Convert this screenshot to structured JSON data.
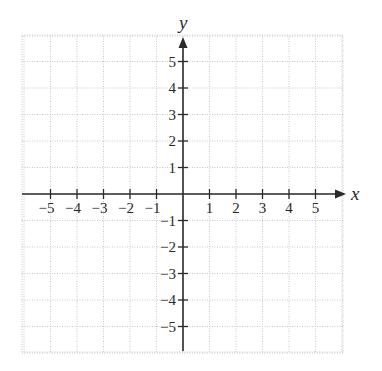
{
  "chart_data": {
    "type": "coordinate-plane",
    "title": "",
    "xlabel": "x",
    "ylabel": "y",
    "xlim": [
      -6,
      6
    ],
    "ylim": [
      -6,
      6
    ],
    "grid": true,
    "grid_style": "dotted",
    "x_ticks": [
      -5,
      -4,
      -3,
      -2,
      -1,
      1,
      2,
      3,
      4,
      5
    ],
    "y_ticks": [
      -5,
      -4,
      -3,
      -2,
      -1,
      1,
      2,
      3,
      4,
      5
    ],
    "x_tick_labels": [
      "−5",
      "−4",
      "−3",
      "−2",
      "−1",
      "1",
      "2",
      "3",
      "4",
      "5"
    ],
    "y_tick_labels": [
      "−5",
      "−4",
      "−3",
      "−2",
      "−1",
      "1",
      "2",
      "3",
      "4",
      "5"
    ],
    "series": [],
    "colors": {
      "axis": "#2a2a2a",
      "grid": "#c8c8c8",
      "background": "#ffffff"
    }
  },
  "layout": {
    "origin_x": 183,
    "origin_y": 194,
    "unit": 26.5,
    "grid_left": 22,
    "grid_right": 343,
    "grid_top": 36,
    "grid_bottom": 352
  }
}
